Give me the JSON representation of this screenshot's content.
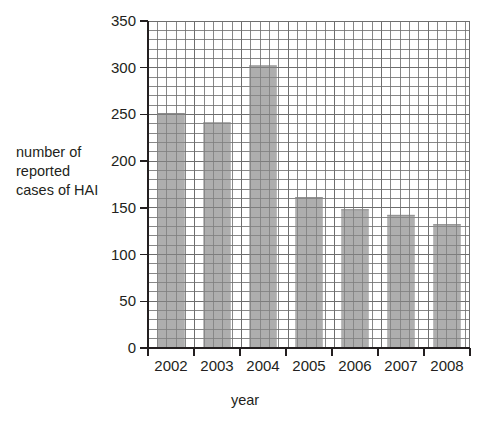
{
  "chart_data": {
    "type": "bar",
    "title": "",
    "xlabel": "year",
    "ylabel": "number of\nreported\ncases of HAI",
    "categories": [
      "2002",
      "2003",
      "2004",
      "2005",
      "2006",
      "2007",
      "2008"
    ],
    "values": [
      251,
      241,
      302,
      161,
      148,
      142,
      132
    ],
    "series": [
      {
        "name": "number of reported cases of HAI",
        "values": [
          251,
          241,
          302,
          161,
          148,
          142,
          132
        ]
      }
    ],
    "ylim": [
      0,
      350
    ],
    "ytick_labels": [
      "0",
      "50",
      "100",
      "150",
      "200",
      "250",
      "300",
      "350"
    ],
    "ytick_values": [
      0,
      50,
      100,
      150,
      200,
      250,
      300,
      350
    ],
    "y_major_step": 50,
    "y_minor_step": 10,
    "grid": "graph-paper minor grid, both axes",
    "legend": "none",
    "bar_color": "#9a9a9a",
    "grid_color": "#6e6e6e",
    "axis_color": "#231f20"
  },
  "axis_labels": {
    "y_title_line1": "number of",
    "y_title_line2": "reported",
    "y_title_line3": "cases of HAI",
    "x_title": "year"
  }
}
